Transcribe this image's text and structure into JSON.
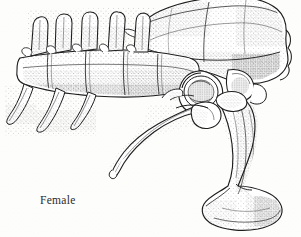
{
  "figure": {
    "domain": "scientific-line-illustration",
    "technique": "pen-and-ink stipple drawing",
    "background_color": "#fdfdfc",
    "ink_color": "#1d1d1d",
    "width_px": 301,
    "height_px": 237
  },
  "label": {
    "text": "Female",
    "x_px": 40,
    "y_px": 194,
    "font_style": "serif",
    "color": "#2b2b2b"
  },
  "anatomy": {
    "parts": [
      {
        "name": "vertebral-column",
        "note": "horizontal series of fused vertebrae running left to right"
      },
      {
        "name": "neural-spines",
        "count": 5,
        "note": "upward blade-like processes above the vertebrae"
      },
      {
        "name": "transverse-processes",
        "count": 3,
        "note": "downward-angled rib-like processes at left"
      },
      {
        "name": "ilium",
        "note": "large dorsal blade arching over the hip, scalloped posterior margin"
      },
      {
        "name": "acetabulum",
        "note": "circular hip socket below the ilium"
      },
      {
        "name": "pubis",
        "note": "slender rod projecting forward and downward to the left"
      },
      {
        "name": "ischium",
        "note": "thick shaft descending to a broad boot-shaped distal expansion"
      }
    ]
  }
}
